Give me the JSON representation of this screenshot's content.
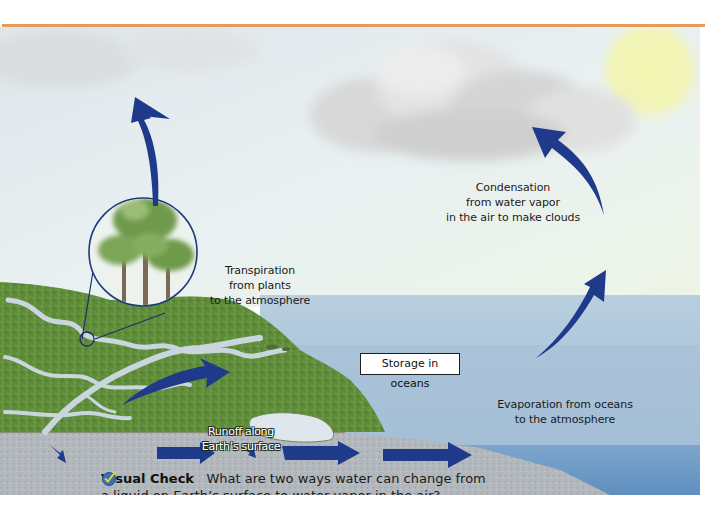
{
  "figure": {
    "accent_rule_color": "#e89a5a",
    "arrow_color": "#1f3a8a",
    "labels": {
      "transpiration": [
        "Transpiration",
        "from plants",
        "to the atmosphere"
      ],
      "condensation": [
        "Condensation",
        "from water vapor",
        "in the air to make clouds"
      ],
      "storage": "Storage in oceans",
      "evaporation": [
        "Evaporation from oceans",
        "to the atmosphere"
      ],
      "runoff": [
        "Runoff along",
        "Earth’s surface"
      ]
    },
    "icons": [
      "transpiration-arrow-icon",
      "condensation-arrow-icon",
      "evaporation-arrow-icon",
      "runoff-arrow-icon",
      "groundwater-arrow-icon",
      "tree-inset-icon",
      "cloud-icon",
      "sun-icon",
      "check-icon"
    ]
  },
  "visual_check": {
    "title": "Visual Check",
    "question_line1": "What are two ways water can change from",
    "question_line2": "a liquid on Earth’s surface to water vapor in the air?"
  }
}
